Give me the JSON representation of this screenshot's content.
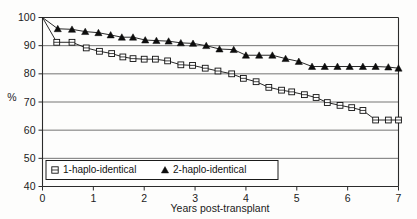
{
  "chart_data": {
    "type": "line",
    "title": "",
    "xlabel": "Years post-transplant",
    "ylabel": "%",
    "xlim": [
      0,
      7
    ],
    "ylim": [
      40,
      100
    ],
    "xticks": [
      "0",
      "1",
      "2",
      "3",
      "4",
      "5",
      "6",
      "7"
    ],
    "yticks": [
      "40",
      "50",
      "60",
      "70",
      "80",
      "90",
      "100"
    ],
    "grid": true,
    "legend_position": "bottom-left",
    "series": [
      {
        "name": "1-haplo-identical",
        "marker": "open-square-with-bar",
        "color": "#111111",
        "x": [
          0.0,
          0.28,
          0.58,
          0.86,
          1.12,
          1.36,
          1.58,
          1.78,
          2.0,
          2.22,
          2.46,
          2.72,
          2.95,
          3.2,
          3.45,
          3.72,
          3.95,
          4.2,
          4.45,
          4.7,
          4.9,
          5.15,
          5.38,
          5.6,
          5.85,
          6.08,
          6.3,
          6.55,
          6.8,
          7.0
        ],
        "y": [
          100.0,
          91.2,
          91.2,
          89.2,
          88.0,
          87.2,
          86.0,
          85.4,
          85.2,
          85.2,
          84.6,
          83.2,
          83.0,
          82.0,
          81.0,
          80.0,
          78.4,
          77.2,
          75.2,
          74.2,
          73.6,
          72.6,
          71.6,
          69.8,
          68.8,
          68.0,
          67.0,
          63.6,
          63.6,
          63.6
        ]
      },
      {
        "name": "2-haplo-identical",
        "marker": "filled-triangle",
        "color": "#0d0d0d",
        "x": [
          0.0,
          0.3,
          0.58,
          0.84,
          1.1,
          1.34,
          1.56,
          1.78,
          2.02,
          2.24,
          2.48,
          2.72,
          2.96,
          3.22,
          3.48,
          3.76,
          4.0,
          4.26,
          4.52,
          4.78,
          5.04,
          5.3,
          5.55,
          5.8,
          6.04,
          6.3,
          6.55,
          6.8,
          7.0
        ],
        "y": [
          100.0,
          96.0,
          95.8,
          95.0,
          94.6,
          93.8,
          93.0,
          93.0,
          92.0,
          91.8,
          91.6,
          91.0,
          90.8,
          90.0,
          88.8,
          88.6,
          86.6,
          86.6,
          86.6,
          85.4,
          84.4,
          82.6,
          82.6,
          82.6,
          82.6,
          82.6,
          82.6,
          82.4,
          82.0
        ]
      }
    ]
  },
  "legend": {
    "items": [
      {
        "label": "1-haplo-identical",
        "marker": "open-square-with-bar"
      },
      {
        "label": "2-haplo-identical",
        "marker": "filled-triangle"
      }
    ]
  }
}
